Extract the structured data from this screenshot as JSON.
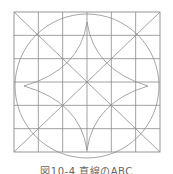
{
  "figure": {
    "grid_divisions": 6,
    "line_color": "#8a8a8a",
    "curve_color": "#8f8f8f"
  },
  "caption": "図10-4 直線のABC"
}
